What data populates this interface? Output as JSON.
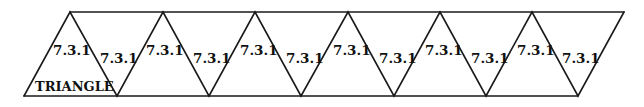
{
  "diagram": {
    "title": "TRIANGLE",
    "stroke_color": "#1a1a1a",
    "background": "#ffffff",
    "top_y": 12,
    "bottom_y": 96,
    "top_vertices_x": [
      70,
      163,
      255,
      348,
      440,
      532
    ],
    "bottom_vertices_x": [
      24,
      117,
      209,
      301,
      394,
      486,
      578
    ],
    "top_right_end_x": 624,
    "triangles": [
      {
        "label": "7.3.1",
        "orientation": "up"
      },
      {
        "label": "7.3.1",
        "orientation": "down"
      },
      {
        "label": "7.3.1",
        "orientation": "up"
      },
      {
        "label": "7.3.1",
        "orientation": "down"
      },
      {
        "label": "7.3.1",
        "orientation": "up"
      },
      {
        "label": "7.3.1",
        "orientation": "down"
      },
      {
        "label": "7.3.1",
        "orientation": "up"
      },
      {
        "label": "7.3.1",
        "orientation": "down"
      },
      {
        "label": "7.3.1",
        "orientation": "up"
      },
      {
        "label": "7.3.1",
        "orientation": "down"
      },
      {
        "label": "7.3.1",
        "orientation": "up"
      },
      {
        "label": "7.3.1",
        "orientation": "down"
      }
    ]
  }
}
